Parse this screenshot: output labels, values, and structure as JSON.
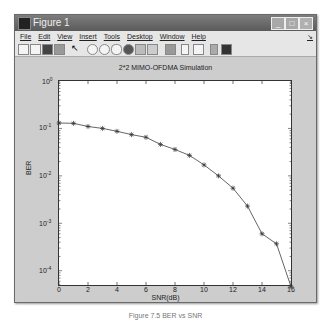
{
  "window": {
    "title": "Figure 1",
    "buttons": {
      "minimize": "_",
      "maximize": "□",
      "close": "×"
    }
  },
  "menubar": {
    "items": [
      "File",
      "Edit",
      "View",
      "Insert",
      "Tools",
      "Desktop",
      "Window",
      "Help"
    ],
    "dock_arrow": "↘"
  },
  "toolbar": {
    "icons": [
      "new-figure-icon",
      "open-file-icon",
      "save-icon",
      "print-icon",
      "pointer-icon",
      "zoom-in-icon",
      "zoom-out-icon",
      "pan-icon",
      "rotate-3d-icon",
      "data-cursor-icon",
      "brush-icon",
      "link-plot-icon",
      "colorbar-icon",
      "legend-icon",
      "hide-plot-tools-icon",
      "show-plot-tools-icon"
    ]
  },
  "plot": {
    "title": "2*2 MIMO-OFDMA Simulation",
    "xlabel": "SNR(dB)",
    "ylabel": "BER",
    "xticks": [
      "0",
      "2",
      "4",
      "6",
      "8",
      "10",
      "12",
      "14",
      "16"
    ],
    "yticks": [
      {
        "base": "10",
        "exp": "0"
      },
      {
        "base": "10",
        "exp": "-1"
      },
      {
        "base": "10",
        "exp": "-2"
      },
      {
        "base": "10",
        "exp": "-3"
      },
      {
        "base": "10",
        "exp": "-4"
      }
    ],
    "line_color": "#555555"
  },
  "caption": "Figure 7.5  BER vs SNR",
  "chart_data": {
    "type": "line",
    "title": "2*2 MIMO-OFDMA Simulation",
    "xlabel": "SNR(dB)",
    "ylabel": "BER",
    "yscale": "log",
    "xlim": [
      0,
      16
    ],
    "ylim": [
      5e-05,
      1
    ],
    "grid": false,
    "x": [
      0,
      1,
      2,
      3,
      4,
      5,
      6,
      7,
      8,
      9,
      10,
      11,
      12,
      13,
      14,
      15,
      16
    ],
    "series": [
      {
        "name": "BER",
        "marker": "*",
        "values": [
          0.13,
          0.128,
          0.11,
          0.1,
          0.087,
          0.074,
          0.065,
          0.046,
          0.036,
          0.027,
          0.017,
          0.01,
          0.0055,
          0.0023,
          0.0006,
          0.00037,
          4.6e-05
        ]
      }
    ]
  }
}
